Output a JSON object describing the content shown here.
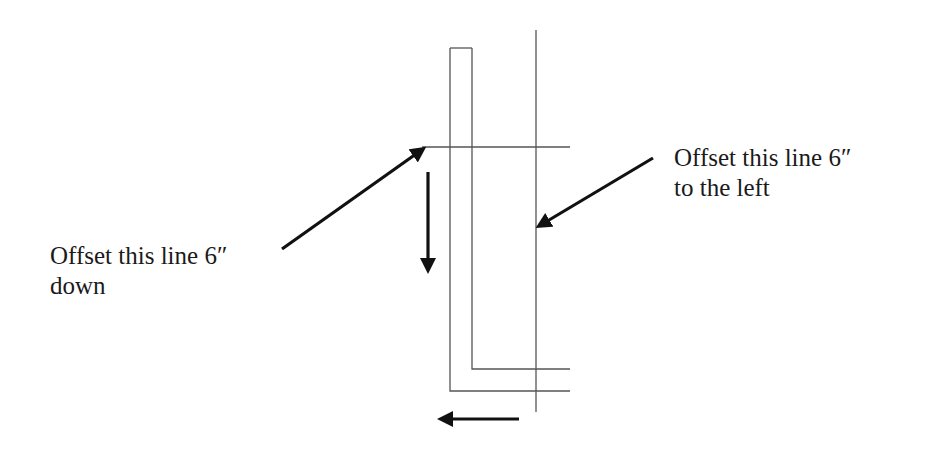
{
  "diagram": {
    "type": "offset-instruction-diagram",
    "colors": {
      "line": "#555555",
      "arrow": "#111111",
      "text": "#1a1a1a",
      "background": "#ffffff"
    },
    "labels": {
      "left": {
        "line1": "Offset this line 6″",
        "line2": "down"
      },
      "right": {
        "line1": "Offset this line 6″",
        "line2": "to the left"
      }
    },
    "shapes": {
      "l_shape": "wall outline (double L)",
      "vertical_line": "line to offset left",
      "horizontal_line": "line to offset down"
    },
    "arrows": [
      {
        "name": "pointer-to-horizontal-line",
        "direction": "up-right"
      },
      {
        "name": "offset-down-arrow",
        "direction": "down"
      },
      {
        "name": "pointer-to-vertical-line",
        "direction": "down-left"
      },
      {
        "name": "offset-left-arrow",
        "direction": "left"
      }
    ]
  }
}
